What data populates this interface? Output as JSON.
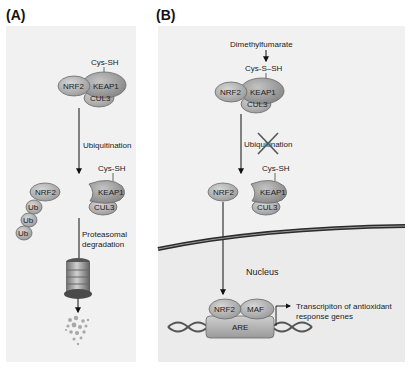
{
  "panels": [
    {
      "id": "A",
      "label": "(A)",
      "complex_top": {
        "cys": "Cys-SH",
        "nrf2": "NRF2",
        "keap1": "KEAP1",
        "cul3": "CUL3"
      },
      "step1": "Ubiquitination",
      "complex_bottom": {
        "cys": "Cys-SH",
        "nrf2": "NRF2",
        "keap1": "KEAP1",
        "cul3": "CUL3"
      },
      "ubiquitins": [
        "Ub",
        "Ub",
        "Ub"
      ],
      "step2_line1": "Proteasomal",
      "step2_line2": "degradation"
    },
    {
      "id": "B",
      "label": "(B)",
      "drug": "Dimethylfumarate",
      "complex_top": {
        "cys": "Cys-S–SH",
        "nrf2": "NRF2",
        "keap1": "KEAP1",
        "cul3": "CUL3"
      },
      "step1_blocked": "Ubiquitination",
      "complex_bottom": {
        "cys": "Cys-SH",
        "nrf2": "NRF2",
        "keap1": "KEAP1",
        "cul3": "CUL3"
      },
      "compartment": "Nucleus",
      "nuclear_complex": {
        "nrf2": "NRF2",
        "maf": "MAF",
        "are": "ARE"
      },
      "output_line1": "Transcripiton of antioxidant",
      "output_line2": "response genes"
    }
  ],
  "colors": {
    "panel_bg": "#f1f1f1",
    "protein_fill": "#b4b4b4",
    "protein_stroke": "#6a6a6a",
    "keap1_fill": "#9c9c9c",
    "membrane": "#2a2a2a"
  }
}
